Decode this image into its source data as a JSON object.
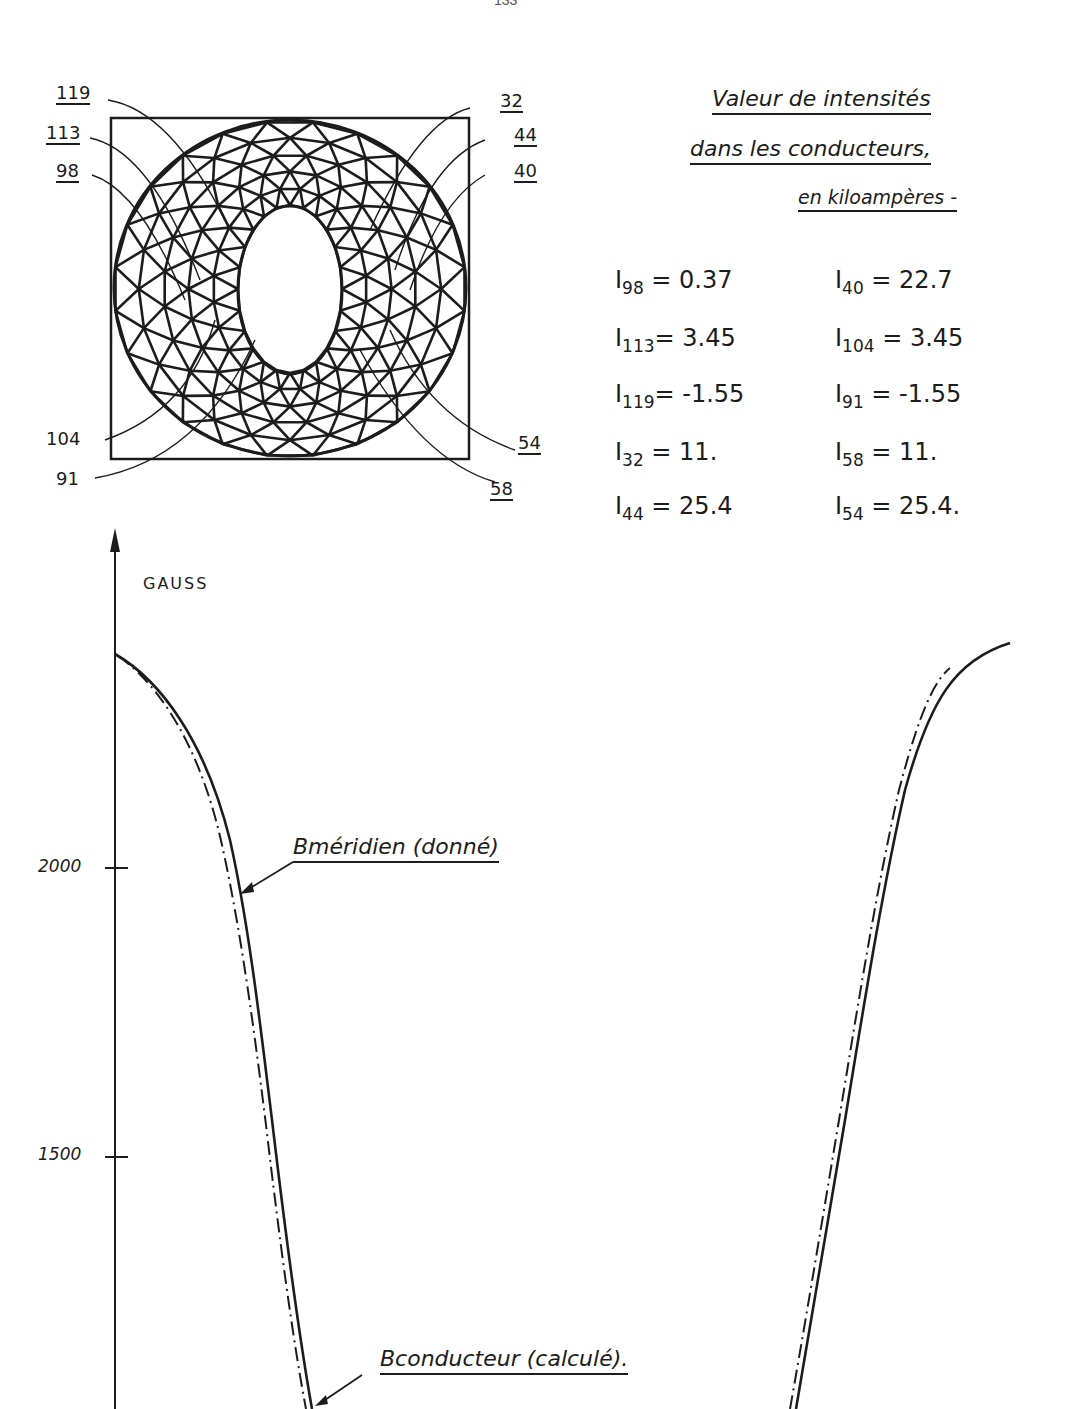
{
  "page": {
    "number": "133"
  },
  "mesh": {
    "node_labels": [
      {
        "id": "119",
        "x": 56,
        "y": 82,
        "underlined": true
      },
      {
        "id": "113",
        "x": 46,
        "y": 122,
        "underlined": true
      },
      {
        "id": "98",
        "x": 56,
        "y": 160,
        "underlined": true
      },
      {
        "id": "32",
        "x": 500,
        "y": 90,
        "underlined": true
      },
      {
        "id": "44",
        "x": 514,
        "y": 124,
        "underlined": true
      },
      {
        "id": "40",
        "x": 514,
        "y": 160,
        "underlined": true
      },
      {
        "id": "104",
        "x": 46,
        "y": 428,
        "underlined": false
      },
      {
        "id": "91",
        "x": 56,
        "y": 468,
        "underlined": false
      },
      {
        "id": "54",
        "x": 518,
        "y": 432,
        "underlined": true
      },
      {
        "id": "58",
        "x": 490,
        "y": 478,
        "underlined": true
      }
    ]
  },
  "intensities": {
    "title_lines": [
      "Valeur de intensités",
      "dans les conducteurs,",
      "en kiloampères -"
    ],
    "rows": [
      {
        "left": {
          "name": "I",
          "sub": "98",
          "value": "0.37"
        },
        "right": {
          "name": "I",
          "sub": "40",
          "value": "22.7"
        }
      },
      {
        "left": {
          "name": "I",
          "sub": "113",
          "value": "3.45"
        },
        "right": {
          "name": "I",
          "sub": "104",
          "value": "3.45"
        }
      },
      {
        "left": {
          "name": "I",
          "sub": "119",
          "value": "-1.55"
        },
        "right": {
          "name": "I",
          "sub": "91",
          "value": "-1.55"
        }
      },
      {
        "left": {
          "name": "I",
          "sub": "32",
          "value": "11."
        },
        "right": {
          "name": "I",
          "sub": "58",
          "value": "11."
        }
      },
      {
        "left": {
          "name": "I",
          "sub": "44",
          "value": "25.4"
        },
        "right": {
          "name": "I",
          "sub": "54",
          "value": "25.4."
        }
      }
    ]
  },
  "chart_data": {
    "type": "line",
    "title": "",
    "xlabel": "",
    "ylabel": "GAUSS",
    "yticks": [
      "2000",
      "1500"
    ],
    "grid": false,
    "legend": "annotations with arrows",
    "series": [
      {
        "name": "Bméridien (donné)",
        "style": "solid",
        "x": [
          0,
          0.1,
          0.2,
          0.3,
          0.4,
          0.5,
          0.6,
          0.7,
          0.8,
          0.9,
          1.0
        ],
        "values": [
          2400,
          2250,
          1950,
          1500,
          1100,
          1050,
          1100,
          1500,
          1950,
          2250,
          2420
        ]
      },
      {
        "name": "Bconducteur (calculé)",
        "style": "dash-dot",
        "x": [
          0,
          0.1,
          0.2,
          0.3,
          0.4,
          0.5,
          0.6,
          0.7,
          0.8,
          0.9,
          1.0
        ],
        "values": [
          2400,
          2240,
          1930,
          1480,
          1090,
          1050,
          1090,
          1480,
          1930,
          2240,
          2420
        ]
      }
    ],
    "annotations": [
      "Bméridien (donné)",
      "Bconducteur (calculé)."
    ]
  }
}
